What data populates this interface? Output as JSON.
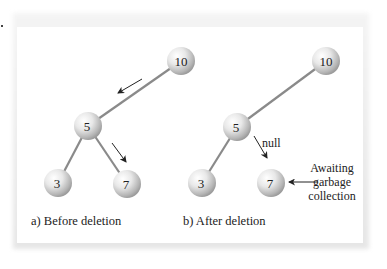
{
  "figure": {
    "panels": [
      {
        "id": "before",
        "caption": "a) Before deletion",
        "nodes": [
          {
            "label": "10",
            "x": 181,
            "y": 61
          },
          {
            "label": "5",
            "x": 88,
            "y": 126
          },
          {
            "label": "3",
            "x": 58,
            "y": 183
          },
          {
            "label": "7",
            "x": 127,
            "y": 184
          }
        ],
        "edges": [
          [
            "10",
            "5"
          ],
          [
            "5",
            "3"
          ],
          [
            "5",
            "7"
          ]
        ],
        "arrows": [
          {
            "from": [
              142,
              79
            ],
            "to": [
              118,
              93
            ],
            "meaning": "traverse left from 10 to 5"
          },
          {
            "from": [
              112,
              143
            ],
            "to": [
              126,
              162
            ],
            "meaning": "traverse right from 5 to 7"
          }
        ]
      },
      {
        "id": "after",
        "caption": "b) After deletion",
        "nodes": [
          {
            "label": "10",
            "x": 326,
            "y": 61
          },
          {
            "label": "5",
            "x": 237,
            "y": 127
          },
          {
            "label": "3",
            "x": 202,
            "y": 183
          },
          {
            "label": "7",
            "x": 271,
            "y": 183
          }
        ],
        "edges": [
          [
            "10",
            "5"
          ],
          [
            "5",
            "3"
          ]
        ],
        "arrows": [
          {
            "from": [
              254,
              136
            ],
            "to": [
              267,
              158
            ],
            "label": "null"
          },
          {
            "from": [
              318,
              182
            ],
            "to": [
              289,
              182
            ],
            "meaning": "points to detached node 7"
          }
        ],
        "annotation": {
          "lines": [
            "Awaiting",
            "garbage",
            "collection"
          ]
        },
        "null_label": "null"
      }
    ],
    "colors": {
      "edge": "#8a8a8a",
      "node_highlight": "#ffffff",
      "node_shadow": "#9c9c9c",
      "text": "#222222",
      "frame_shadow": "#e6e6e6"
    }
  }
}
